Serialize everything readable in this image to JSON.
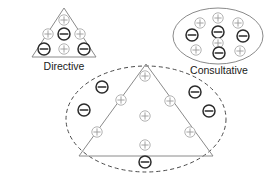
{
  "diagram": {
    "colors": {
      "background": "#ffffff",
      "outline_solid": "#8a8a8a",
      "outline_dashed": "#4a4a4a",
      "plus_stroke": "#a9a9a9",
      "minus_stroke": "#2b2b2b",
      "label_text": "#1a1a1a"
    },
    "symbols": {
      "plus": "+",
      "minus": "−"
    },
    "groups": [
      {
        "id": "directive",
        "label": "Directive",
        "shape": "triangle",
        "outline_style": "solid",
        "label_position": "below",
        "tokens": [
          {
            "sign": "plus",
            "x": 64,
            "y": 20
          },
          {
            "sign": "plus",
            "x": 48,
            "y": 34
          },
          {
            "sign": "minus",
            "x": 64,
            "y": 34
          },
          {
            "sign": "plus",
            "x": 80,
            "y": 34
          },
          {
            "sign": "minus",
            "x": 44,
            "y": 49
          },
          {
            "sign": "plus",
            "x": 64,
            "y": 49
          },
          {
            "sign": "minus",
            "x": 84,
            "y": 49
          }
        ]
      },
      {
        "id": "consultative",
        "label": "Consultative",
        "shape": "ellipse",
        "outline_style": "solid",
        "label_position": "below",
        "tokens": [
          {
            "sign": "plus",
            "x": 200,
            "y": 23
          },
          {
            "sign": "plus",
            "x": 218,
            "y": 18
          },
          {
            "sign": "plus",
            "x": 238,
            "y": 23
          },
          {
            "sign": "minus",
            "x": 192,
            "y": 35
          },
          {
            "sign": "minus",
            "x": 218,
            "y": 32
          },
          {
            "sign": "minus",
            "x": 243,
            "y": 36
          },
          {
            "sign": "plus",
            "x": 218,
            "y": 43
          },
          {
            "sign": "plus",
            "x": 196,
            "y": 50
          },
          {
            "sign": "minus",
            "x": 219,
            "y": 53
          },
          {
            "sign": "plus",
            "x": 240,
            "y": 51
          }
        ]
      },
      {
        "id": "combined",
        "label": "",
        "shape": "triangle-and-ellipse",
        "outline_style": "solid-and-dashed",
        "label_position": "none",
        "tokens": [
          {
            "sign": "plus",
            "x": 145,
            "y": 76
          },
          {
            "sign": "minus",
            "x": 102,
            "y": 87
          },
          {
            "sign": "minus",
            "x": 195,
            "y": 92
          },
          {
            "sign": "plus",
            "x": 121,
            "y": 100
          },
          {
            "sign": "plus",
            "x": 170,
            "y": 101
          },
          {
            "sign": "minus",
            "x": 84,
            "y": 110
          },
          {
            "sign": "minus",
            "x": 209,
            "y": 111
          },
          {
            "sign": "plus",
            "x": 145,
            "y": 116
          },
          {
            "sign": "plus",
            "x": 97,
            "y": 132
          },
          {
            "sign": "plus",
            "x": 190,
            "y": 132
          },
          {
            "sign": "plus",
            "x": 145,
            "y": 145
          },
          {
            "sign": "minus",
            "x": 145,
            "y": 162
          }
        ]
      }
    ]
  }
}
